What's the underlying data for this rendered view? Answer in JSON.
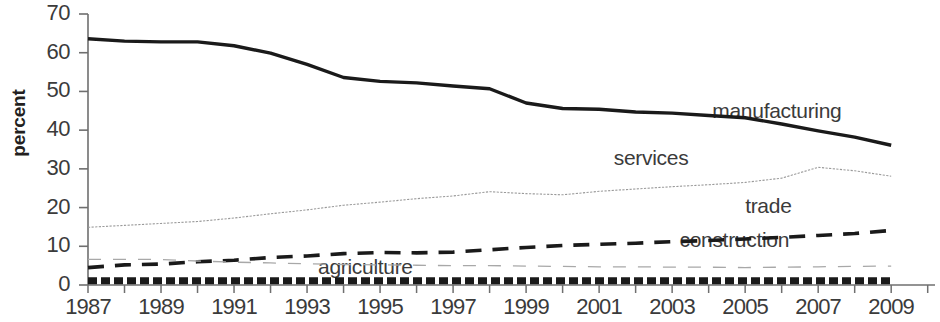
{
  "chart_data": {
    "type": "line",
    "title": "",
    "xlabel": "",
    "ylabel": "percent",
    "xlim": [
      1987,
      2010.2
    ],
    "ylim": [
      0,
      70
    ],
    "yticks": [
      0,
      10,
      20,
      30,
      40,
      50,
      60,
      70
    ],
    "xticks": [
      1987,
      1989,
      1991,
      1993,
      1995,
      1997,
      1999,
      2001,
      2003,
      2005,
      2007,
      2009
    ],
    "xtick_labels": [
      "1987",
      "1989",
      "1991",
      "1993",
      "1995",
      "1997",
      "1999",
      "2001",
      "2003",
      "2005",
      "2007",
      "2009"
    ],
    "ytick_labels": [
      "0",
      "10",
      "20",
      "30",
      "40",
      "50",
      "60",
      "70"
    ],
    "x_minor_tick_interval": 1,
    "grid": false,
    "legend": "inline-labels",
    "x": [
      1987,
      1988,
      1989,
      1990,
      1991,
      1992,
      1993,
      1994,
      1995,
      1996,
      1997,
      1998,
      1999,
      2000,
      2001,
      2002,
      2003,
      2004,
      2005,
      2006,
      2007,
      2008,
      2009
    ],
    "series": [
      {
        "name": "manufacturing",
        "style": "solid-thick",
        "color": "#1a1a1a",
        "label_x": 2004.1,
        "label_y": 44.5,
        "values": [
          63.6,
          63.0,
          62.8,
          62.8,
          61.8,
          59.9,
          57.0,
          53.6,
          52.6,
          52.2,
          51.4,
          50.7,
          47.0,
          45.6,
          45.4,
          44.7,
          44.4,
          43.8,
          43.2,
          41.6,
          39.8,
          38.2,
          36.1
        ]
      },
      {
        "name": "services",
        "style": "dotted-fine",
        "color": "#9a9a9a",
        "label_x": 2001.4,
        "label_y": 32.3,
        "values": [
          14.9,
          15.4,
          15.9,
          16.4,
          17.3,
          18.4,
          19.4,
          20.6,
          21.4,
          22.3,
          23.0,
          24.1,
          23.6,
          23.3,
          24.2,
          24.8,
          25.4,
          25.9,
          26.5,
          27.6,
          30.4,
          29.5,
          28.1
        ]
      },
      {
        "name": "trade",
        "style": "dashed-bold",
        "color": "#1a1a1a",
        "label_x": 2005.0,
        "label_y": 19.8,
        "values": [
          4.5,
          5.2,
          5.4,
          6.0,
          6.4,
          7.1,
          7.5,
          8.1,
          8.4,
          8.3,
          8.5,
          9.1,
          9.7,
          10.2,
          10.5,
          10.8,
          11.2,
          11.5,
          11.9,
          12.3,
          12.8,
          13.3,
          14.1
        ]
      },
      {
        "name": "construction",
        "style": "dashed-fine",
        "color": "#a8a8a8",
        "label_x": 2003.2,
        "label_y": 11.0,
        "values": [
          6.6,
          6.6,
          6.6,
          6.2,
          5.9,
          5.7,
          5.5,
          5.3,
          5.2,
          5.1,
          5.0,
          5.0,
          4.9,
          4.8,
          4.7,
          4.7,
          4.6,
          4.6,
          4.5,
          4.6,
          4.7,
          4.8,
          4.9
        ]
      },
      {
        "name": "agriculture",
        "style": "dashed-heavy",
        "color": "#1a1a1a",
        "label_x": 1993.3,
        "label_y": 4.2,
        "values": [
          1.1,
          1.1,
          1.1,
          1.1,
          1.1,
          1.1,
          1.1,
          1.1,
          1.1,
          1.1,
          1.1,
          1.1,
          1.1,
          1.1,
          1.1,
          1.1,
          1.1,
          1.1,
          1.1,
          1.1,
          1.1,
          1.1,
          1.1
        ]
      }
    ]
  }
}
